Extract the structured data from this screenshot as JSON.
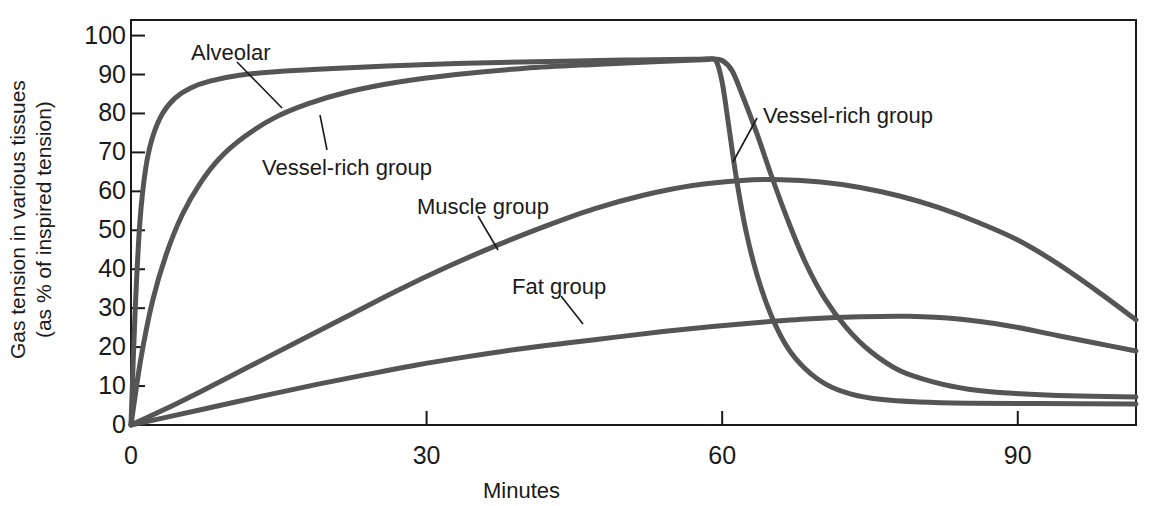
{
  "chart_data": {
    "type": "line",
    "title": "",
    "xlabel": "Minutes",
    "ylabel": "Gas tension in various tissues (as % of inspired tension)",
    "ylabel_line1": "Gas tension in various tissues",
    "ylabel_line2": "(as % of inspired tension)",
    "xlim": [
      0,
      102
    ],
    "ylim": [
      0,
      104
    ],
    "xticks": [
      0,
      30,
      60,
      90
    ],
    "xtick_labels": [
      "0",
      "30",
      "60",
      "90"
    ],
    "yticks": [
      0,
      10,
      20,
      30,
      40,
      50,
      60,
      70,
      80,
      90,
      100
    ],
    "ytick_labels": [
      "0",
      "10",
      "20",
      "30",
      "40",
      "50",
      "60",
      "70",
      "80",
      "90",
      "100"
    ],
    "grid": false,
    "legend_position": "inline-annotations",
    "line_color": "#555555",
    "axis_color": "#1a1a1a",
    "series": [
      {
        "name": "Alveolar",
        "points": [
          [
            0,
            0
          ],
          [
            0.4,
            28
          ],
          [
            0.9,
            52
          ],
          [
            1.5,
            66
          ],
          [
            2.2,
            74
          ],
          [
            3.2,
            80
          ],
          [
            4.5,
            84
          ],
          [
            6,
            86.5
          ],
          [
            8,
            88.3
          ],
          [
            11,
            89.8
          ],
          [
            15,
            90.8
          ],
          [
            20,
            91.5
          ],
          [
            26,
            92.2
          ],
          [
            33,
            92.8
          ],
          [
            41,
            93.3
          ],
          [
            50,
            93.7
          ],
          [
            57,
            93.9
          ],
          [
            58.6,
            94.0
          ],
          [
            59.4,
            93.4
          ],
          [
            60,
            88
          ],
          [
            60.6,
            78
          ],
          [
            61.4,
            64
          ],
          [
            62.4,
            50
          ],
          [
            63.6,
            38
          ],
          [
            65,
            28
          ],
          [
            66.6,
            20
          ],
          [
            68.4,
            14.5
          ],
          [
            70.5,
            10.5
          ],
          [
            73,
            8
          ],
          [
            76,
            6.6
          ],
          [
            80,
            5.9
          ],
          [
            85,
            5.6
          ],
          [
            92,
            5.5
          ],
          [
            102,
            5.4
          ]
        ]
      },
      {
        "name": "Vessel-rich group",
        "points": [
          [
            0,
            0
          ],
          [
            1,
            17
          ],
          [
            2.2,
            32
          ],
          [
            3.6,
            44
          ],
          [
            5.2,
            54
          ],
          [
            7,
            62
          ],
          [
            9,
            68.5
          ],
          [
            11.5,
            74
          ],
          [
            14.5,
            78.8
          ],
          [
            18,
            82.5
          ],
          [
            22,
            85.5
          ],
          [
            27,
            88
          ],
          [
            33,
            90
          ],
          [
            40,
            91.6
          ],
          [
            47,
            92.6
          ],
          [
            53,
            93.3
          ],
          [
            58,
            93.8
          ],
          [
            59,
            94.0
          ],
          [
            60,
            93.6
          ],
          [
            61,
            91
          ],
          [
            62,
            85
          ],
          [
            63.5,
            75
          ],
          [
            65,
            64
          ],
          [
            66.6,
            53
          ],
          [
            68.4,
            42
          ],
          [
            70.4,
            32.5
          ],
          [
            72.6,
            25
          ],
          [
            75,
            19
          ],
          [
            78,
            14
          ],
          [
            81.5,
            11
          ],
          [
            85,
            9.2
          ],
          [
            89,
            8.2
          ],
          [
            94,
            7.6
          ],
          [
            102,
            7.2
          ]
        ]
      },
      {
        "name": "Muscle group",
        "points": [
          [
            0,
            0
          ],
          [
            3,
            3.5
          ],
          [
            7,
            8.5
          ],
          [
            12,
            15
          ],
          [
            17,
            21.5
          ],
          [
            22,
            28
          ],
          [
            27,
            34.5
          ],
          [
            32,
            40.5
          ],
          [
            37,
            46
          ],
          [
            42,
            51
          ],
          [
            47,
            55.5
          ],
          [
            52,
            59
          ],
          [
            57,
            61.5
          ],
          [
            62,
            62.8
          ],
          [
            66,
            63.0
          ],
          [
            70,
            62.4
          ],
          [
            74,
            61
          ],
          [
            78,
            58.8
          ],
          [
            82,
            55.8
          ],
          [
            86,
            52
          ],
          [
            90,
            47.5
          ],
          [
            94,
            41.5
          ],
          [
            98,
            34.5
          ],
          [
            102,
            27
          ]
        ]
      },
      {
        "name": "Fat group",
        "points": [
          [
            0,
            0
          ],
          [
            4,
            2.2
          ],
          [
            9,
            5
          ],
          [
            14,
            7.8
          ],
          [
            19,
            10.5
          ],
          [
            24,
            13
          ],
          [
            29,
            15.4
          ],
          [
            34,
            17.5
          ],
          [
            39,
            19.4
          ],
          [
            44,
            21
          ],
          [
            49,
            22.5
          ],
          [
            54,
            24
          ],
          [
            59,
            25.3
          ],
          [
            64,
            26.4
          ],
          [
            69,
            27.3
          ],
          [
            74,
            27.8
          ],
          [
            79,
            27.9
          ],
          [
            84,
            27.2
          ],
          [
            89,
            25.5
          ],
          [
            94,
            23
          ],
          [
            98,
            21
          ],
          [
            102,
            19
          ]
        ]
      }
    ],
    "annotations": [
      {
        "id": "alveolar-label",
        "text": "Alveolar",
        "text_x_px": 191,
        "text_y_px": 42,
        "leader": {
          "x1": 237,
          "y1": 62,
          "x2": 282,
          "y2": 108
        }
      },
      {
        "id": "vessel-rich-rise-label",
        "text": "Vessel-rich group",
        "text_x_px": 262,
        "text_y_px": 157,
        "leader": {
          "x1": 327,
          "y1": 150,
          "x2": 320,
          "y2": 115
        }
      },
      {
        "id": "muscle-label",
        "text": "Muscle group",
        "text_x_px": 417,
        "text_y_px": 196,
        "leader": {
          "x1": 478,
          "y1": 216,
          "x2": 498,
          "y2": 250
        }
      },
      {
        "id": "fat-label",
        "text": "Fat group",
        "text_x_px": 512,
        "text_y_px": 276,
        "leader": {
          "x1": 561,
          "y1": 296,
          "x2": 583,
          "y2": 324
        }
      },
      {
        "id": "vessel-rich-fall-label",
        "text": "Vessel-rich group",
        "text_x_px": 763,
        "text_y_px": 105,
        "leader": {
          "x1": 757,
          "y1": 118,
          "x2": 733,
          "y2": 162
        }
      }
    ]
  }
}
